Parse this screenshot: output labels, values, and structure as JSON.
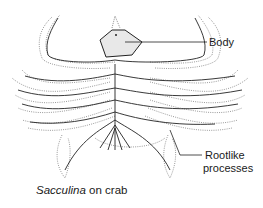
{
  "figure": {
    "subject": "Sacculina on crab",
    "labels": [
      {
        "id": "body",
        "text": "Body"
      },
      {
        "id": "rootlike",
        "line1": "Rootlike",
        "line2": "processes"
      }
    ],
    "caption": {
      "italic": "Sacculina",
      "rest": " on crab"
    }
  }
}
